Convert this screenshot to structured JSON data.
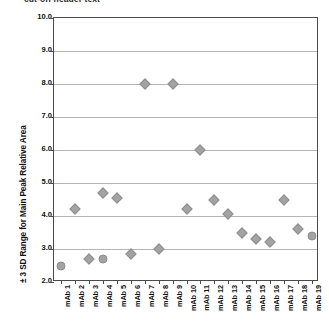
{
  "caption": {
    "text": "cut-off header text"
  },
  "chart_data": {
    "type": "scatter",
    "title": "",
    "xlabel": "",
    "ylabel": "± 3 SD Range for Main Peak Relative Area",
    "ylim": [
      2.0,
      10.0
    ],
    "ytick_labels": [
      "10.0",
      "9.0",
      "8.0",
      "7.0",
      "6.0",
      "5.0",
      "4.0",
      "3.0",
      "2.0"
    ],
    "ytick_values": [
      10.0,
      9.0,
      8.0,
      7.0,
      6.0,
      5.0,
      4.0,
      3.0,
      2.0
    ],
    "grid": true,
    "legend": "none",
    "marker_color": "#a3a3a3",
    "categories": [
      "mAb 1",
      "mAb 2",
      "mAb 3",
      "mAb 4",
      "mAb 5",
      "mAb 6",
      "mAb 7",
      "mAb 8",
      "mAb 9",
      "mAb 10",
      "mAb 11",
      "mAb 12",
      "mAb 13",
      "mAb 14",
      "mAb 15",
      "mAb 16",
      "mAb 17",
      "mAb 18",
      "mAb 19"
    ],
    "points": [
      {
        "category": "mAb 1",
        "index": 0,
        "value": 2.5,
        "shape": "round"
      },
      {
        "category": "mAb 2",
        "index": 1,
        "value": 4.2,
        "shape": "diamond"
      },
      {
        "category": "mAb 3",
        "index": 2,
        "value": 2.7,
        "shape": "diamond"
      },
      {
        "category": "mAb 4",
        "index": 3,
        "value": 4.7,
        "shape": "diamond"
      },
      {
        "category": "mAb 4",
        "index": 3,
        "value": 2.7,
        "shape": "round"
      },
      {
        "category": "mAb 5",
        "index": 4,
        "value": 4.55,
        "shape": "diamond"
      },
      {
        "category": "mAb 6",
        "index": 5,
        "value": 2.85,
        "shape": "diamond"
      },
      {
        "category": "mAb 7",
        "index": 6,
        "value": 8.0,
        "shape": "diamond"
      },
      {
        "category": "mAb 8",
        "index": 7,
        "value": 3.0,
        "shape": "diamond"
      },
      {
        "category": "mAb 9",
        "index": 8,
        "value": 8.0,
        "shape": "diamond"
      },
      {
        "category": "mAb 10",
        "index": 9,
        "value": 4.2,
        "shape": "diamond"
      },
      {
        "category": "mAb 11",
        "index": 10,
        "value": 6.0,
        "shape": "diamond"
      },
      {
        "category": "mAb 12",
        "index": 11,
        "value": 4.5,
        "shape": "diamond"
      },
      {
        "category": "mAb 13",
        "index": 12,
        "value": 4.05,
        "shape": "diamond"
      },
      {
        "category": "mAb 14",
        "index": 13,
        "value": 3.5,
        "shape": "diamond"
      },
      {
        "category": "mAb 15",
        "index": 14,
        "value": 3.3,
        "shape": "diamond"
      },
      {
        "category": "mAb 16",
        "index": 15,
        "value": 3.2,
        "shape": "diamond"
      },
      {
        "category": "mAb 17",
        "index": 16,
        "value": 4.5,
        "shape": "diamond"
      },
      {
        "category": "mAb 18",
        "index": 17,
        "value": 3.6,
        "shape": "diamond"
      },
      {
        "category": "mAb 19",
        "index": 18,
        "value": 3.4,
        "shape": "round"
      }
    ]
  }
}
